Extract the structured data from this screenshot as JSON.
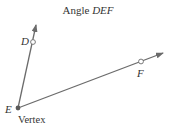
{
  "title": {
    "prefix": "Angle ",
    "name": "DEF"
  },
  "points": {
    "D": {
      "label": "D"
    },
    "E": {
      "label": "E",
      "caption": "Vertex"
    },
    "F": {
      "label": "F"
    }
  },
  "colors": {
    "ray": "#6b6b6b",
    "vertex": "#5a5a5a",
    "text": "#333333"
  }
}
